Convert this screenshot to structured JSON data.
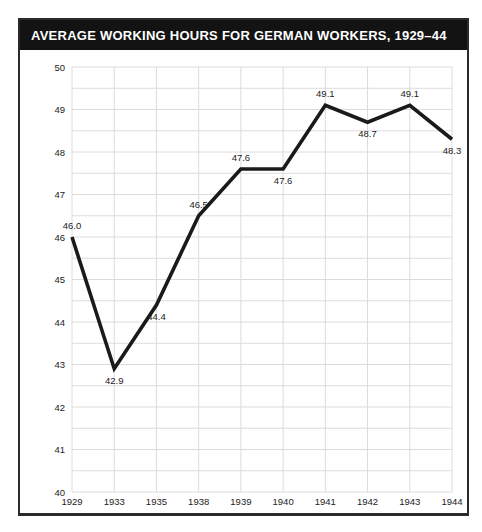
{
  "header": {
    "title": "AVERAGE WORKING HOURS FOR GERMAN WORKERS, 1929–44"
  },
  "colors": {
    "title_bar_bg": "#131313",
    "title_text": "#ffffff",
    "card_border": "#2b2b2b",
    "grid": "#dcdcdc",
    "line": "#1a1a1a",
    "label_text": "#1c1c1c"
  },
  "chart_data": {
    "type": "line",
    "title": "AVERAGE WORKING HOURS FOR GERMAN WORKERS, 1929–44",
    "categories": [
      "1929",
      "1933",
      "1935",
      "1938",
      "1939",
      "1940",
      "1941",
      "1942",
      "1943",
      "1944"
    ],
    "values": [
      46.0,
      42.9,
      44.4,
      46.5,
      47.6,
      47.6,
      49.1,
      48.7,
      49.1,
      48.3
    ],
    "point_labels": [
      "46.0",
      "42.9",
      "44.4",
      "46.5",
      "47.6",
      "47.6",
      "49.1",
      "48.7",
      "49.1",
      "48.3"
    ],
    "label_positions": [
      "above",
      "below",
      "below",
      "above",
      "above",
      "below",
      "above",
      "below",
      "above",
      "below"
    ],
    "xlabel": "",
    "ylabel": "",
    "ylim": [
      40,
      50
    ],
    "y_tick_step": 1,
    "y_tick_labels": [
      "40",
      "41",
      "42",
      "43",
      "44",
      "45",
      "46",
      "47",
      "48",
      "49",
      "50"
    ],
    "grid": true,
    "grid_minor_step": 0.5,
    "legend": "none",
    "line_color": "#1a1a1a",
    "grid_color": "#dcdcdc",
    "line_width": 3.6
  }
}
